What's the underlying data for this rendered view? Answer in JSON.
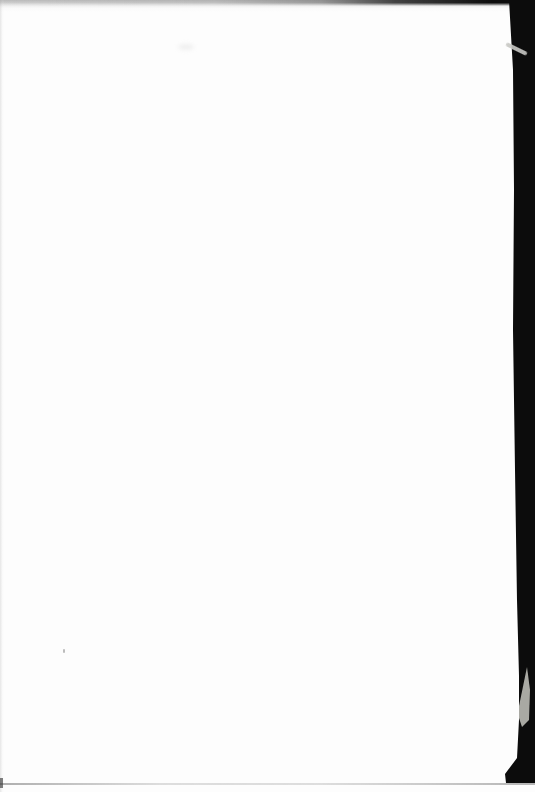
{
  "page": {
    "kind": "scanned-blank-book-page",
    "visible_text": ""
  },
  "colors": {
    "paper": "#fdfdfd",
    "scan-band-black": "#0c0c0c",
    "streak-gray": "#c8c8c4",
    "wedge-gray": "#b7b7b1",
    "speck-gray": "#9a9a9a",
    "bottom-line-gray": "#8f8f8f",
    "top-shadow-gray": "#bdbdbd"
  },
  "artifacts": {
    "top_edge_shadow": "gray scan shadow across top edge, darkening toward right",
    "right_band": "solid black scanner band along right edge, ends just above bottom",
    "band_streak": "light diagonal streak inside black band near top",
    "corner_wedge": "pale page-corner wedge inside black band near bottom",
    "bottom_edge_line": "faint gray line along bottom edge",
    "dust_speck": "tiny gray speck on left-center of page"
  }
}
